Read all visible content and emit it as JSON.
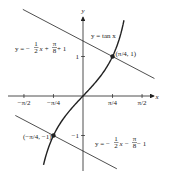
{
  "diagram": {
    "function_label": "y = tan x",
    "axes": {
      "x_label": "x",
      "y_label": "y"
    },
    "x_ticks": [
      {
        "value": -1.5708,
        "label": "−π/2"
      },
      {
        "value": -0.7854,
        "label": "−π/4"
      },
      {
        "value": 0.7854,
        "label": "π/4"
      },
      {
        "value": 1.5708,
        "label": "π/2"
      }
    ],
    "y_ticks": [
      {
        "value": 1,
        "label": "1"
      },
      {
        "value": -1,
        "label": "−1"
      }
    ],
    "points": [
      {
        "x": 0.7854,
        "y": 1,
        "label": "(π/4, 1)"
      },
      {
        "x": -0.7854,
        "y": -1,
        "label": "(−π/4, −1)"
      }
    ],
    "lines": [
      {
        "name": "upper",
        "slope": -0.5,
        "intercept": 1.3927,
        "x_range": [
          -1.6,
          1.9
        ],
        "label_parts": [
          "y = −",
          "1",
          "2",
          "x + ",
          "π",
          "8",
          " + 1"
        ]
      },
      {
        "name": "lower",
        "slope": -0.5,
        "intercept": -1.3927,
        "x_range": [
          -1.8,
          0.9
        ],
        "label_parts": [
          "y = −",
          "1",
          "2",
          "x − ",
          "π",
          "8",
          " − 1"
        ]
      }
    ],
    "curve": {
      "function": "tan",
      "x_range": [
        -1.05,
        1.09
      ]
    },
    "colors": {
      "ink": "#222222"
    }
  }
}
